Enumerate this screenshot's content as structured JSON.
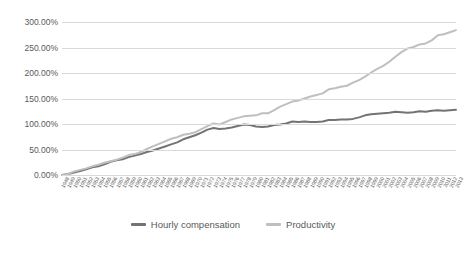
{
  "chart_data": {
    "type": "line",
    "title": "",
    "subtitle": "",
    "xlabel": "",
    "ylabel": "",
    "ylim": [
      0,
      300
    ],
    "ytick_labels": [
      "300.00%",
      "250.00%",
      "200.00%",
      "150.00%",
      "100.00%",
      "50.00%",
      "0.00%"
    ],
    "ytick_values": [
      300,
      250,
      200,
      150,
      100,
      50,
      0
    ],
    "grid": true,
    "legend_position": "bottom",
    "x": [
      1948,
      1949,
      1950,
      1951,
      1952,
      1953,
      1954,
      1955,
      1956,
      1957,
      1958,
      1959,
      1960,
      1961,
      1962,
      1963,
      1964,
      1965,
      1966,
      1967,
      1968,
      1969,
      1970,
      1971,
      1972,
      1973,
      1974,
      1975,
      1976,
      1977,
      1978,
      1979,
      1980,
      1981,
      1982,
      1983,
      1984,
      1985,
      1986,
      1987,
      1988,
      1989,
      1990,
      1991,
      1992,
      1993,
      1994,
      1995,
      1996,
      1997,
      1998,
      1999,
      2000,
      2001,
      2002,
      2003,
      2004,
      2005,
      2006,
      2007,
      2008,
      2009,
      2010,
      2011,
      2012,
      2013
    ],
    "xtick_labels": [
      "1948",
      "1949",
      "1950",
      "1951",
      "1952",
      "1953",
      "1954",
      "1955",
      "1956",
      "1957",
      "1958",
      "1959",
      "1960",
      "1961",
      "1962",
      "1963",
      "1964",
      "1965",
      "1966",
      "1967",
      "1968",
      "1969",
      "1970",
      "1971",
      "1972",
      "1973",
      "1974",
      "1975",
      "1976",
      "1977",
      "1978",
      "1979",
      "1980",
      "1981",
      "1982",
      "1983",
      "1984",
      "1985",
      "1986",
      "1987",
      "1988",
      "1989",
      "1990",
      "1991",
      "1992",
      "1993",
      "1994",
      "1995",
      "1996",
      "1997",
      "1998",
      "1999",
      "2000",
      "2001",
      "2002",
      "2003",
      "2004",
      "2005",
      "2006",
      "2007",
      "2008",
      "2009",
      "2010",
      "2011",
      "2012",
      "2013"
    ],
    "series": [
      {
        "name": "Hourly compensation",
        "color": "#737373",
        "values": [
          0,
          2,
          5,
          8,
          11,
          15,
          17,
          21,
          26,
          29,
          31,
          35,
          38,
          41,
          45,
          48,
          52,
          56,
          60,
          64,
          70,
          74,
          78,
          83,
          89,
          92,
          90,
          91,
          93,
          96,
          99,
          98,
          95,
          94,
          95,
          98,
          99,
          101,
          105,
          104,
          105,
          104,
          104,
          105,
          108,
          108,
          109,
          109,
          110,
          113,
          117,
          119,
          120,
          121,
          122,
          124,
          123,
          122,
          123,
          125,
          124,
          126,
          127,
          126,
          127,
          128
        ],
        "final_value": 110
      },
      {
        "name": "Productivity",
        "color": "#bfbfbf",
        "values": [
          0,
          2,
          7,
          10,
          13,
          17,
          20,
          24,
          27,
          30,
          34,
          39,
          41,
          45,
          51,
          56,
          61,
          66,
          71,
          74,
          79,
          81,
          84,
          90,
          96,
          101,
          99,
          104,
          109,
          112,
          115,
          116,
          117,
          121,
          121,
          127,
          134,
          139,
          144,
          146,
          150,
          154,
          157,
          160,
          168,
          170,
          173,
          175,
          181,
          186,
          193,
          201,
          208,
          214,
          222,
          232,
          241,
          248,
          251,
          256,
          258,
          264,
          274,
          276,
          280,
          284
        ],
        "final_value": 245
      }
    ]
  },
  "legend": {
    "items": [
      {
        "label": "Hourly compensation",
        "color": "#737373"
      },
      {
        "label": "Productivity",
        "color": "#bfbfbf"
      }
    ]
  }
}
